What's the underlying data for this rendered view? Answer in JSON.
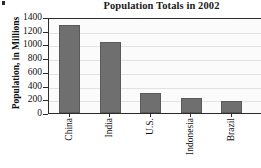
{
  "chart_data": {
    "type": "bar",
    "title": "Population Totals in 2002",
    "xlabel": "",
    "ylabel": "Population, in Millions",
    "categories": [
      "China",
      "India",
      "U.S.",
      "Indonesia",
      "Brazil"
    ],
    "values": [
      1280,
      1040,
      290,
      220,
      180
    ],
    "ylim": [
      0,
      1400
    ],
    "ytick_values": [
      0,
      200,
      400,
      600,
      800,
      1000,
      1200,
      1400
    ],
    "ytick_labels": [
      "0",
      "200",
      "400",
      "600",
      "800",
      "1000",
      "1200",
      "1400"
    ],
    "grid": true,
    "legend": false,
    "bar_color": "#6f6f6f",
    "bar_edge_color": "#5a5a5a",
    "plot_background": "#fbfbfb",
    "axis_color": "#2b2b2b",
    "gridline_color": "#e2e2e2",
    "text_color": "#111111",
    "note": "plot area is cropped at the right edge of the image"
  }
}
